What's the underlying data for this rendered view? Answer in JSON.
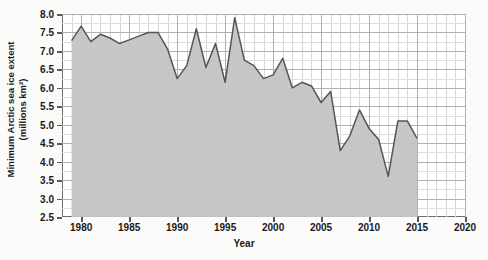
{
  "chart_data": {
    "type": "area",
    "title": "",
    "xlabel": "Year",
    "ylabel": "Minimum Arctic sea ice extent (millions km²)",
    "ylabel_line1": "Minimum Arctic sea ice extent",
    "ylabel_line2": "(millions km²)",
    "xlim": [
      1978,
      2020
    ],
    "ylim": [
      2.5,
      8.0
    ],
    "grid": true,
    "legend": null,
    "x_ticks": [
      1980,
      1985,
      1990,
      1995,
      2000,
      2005,
      2010,
      2015,
      2020
    ],
    "x_tick_labels": [
      "1980",
      "1985",
      "1990",
      "1995",
      "2000",
      "2005",
      "2010",
      "2015",
      "2020"
    ],
    "y_ticks": [
      2.5,
      3.0,
      3.5,
      4.0,
      4.5,
      5.0,
      5.5,
      6.0,
      6.5,
      7.0,
      7.5,
      8.0
    ],
    "y_tick_labels": [
      "2.5",
      "3.0",
      "3.5",
      "4.0",
      "4.5",
      "5.0",
      "5.5",
      "6.0",
      "6.5",
      "7.0",
      "7.5",
      "8.0"
    ],
    "x_minor_step": 1,
    "y_minor_step": 0.25,
    "fill_color": "#c4c4c4",
    "line_color": "#555555",
    "grid_color": "#b0b0b0",
    "axis_color": "#6e6e6e",
    "series": [
      {
        "name": "Minimum Arctic sea ice extent",
        "x": [
          1979,
          1980,
          1981,
          1982,
          1983,
          1984,
          1985,
          1986,
          1987,
          1988,
          1989,
          1990,
          1991,
          1992,
          1993,
          1994,
          1995,
          1996,
          1997,
          1998,
          1999,
          2000,
          2001,
          2002,
          2003,
          2004,
          2005,
          2006,
          2007,
          2008,
          2009,
          2010,
          2011,
          2012,
          2013,
          2014,
          2015
        ],
        "values": [
          7.28,
          7.67,
          7.25,
          7.45,
          7.35,
          7.2,
          7.3,
          7.4,
          7.5,
          7.5,
          7.05,
          6.25,
          6.6,
          7.6,
          6.55,
          7.2,
          6.15,
          7.9,
          6.75,
          6.6,
          6.25,
          6.35,
          6.8,
          6.0,
          6.15,
          6.05,
          5.6,
          5.9,
          4.3,
          4.7,
          5.4,
          4.9,
          4.6,
          3.6,
          5.1,
          5.1,
          4.63
        ]
      }
    ]
  }
}
